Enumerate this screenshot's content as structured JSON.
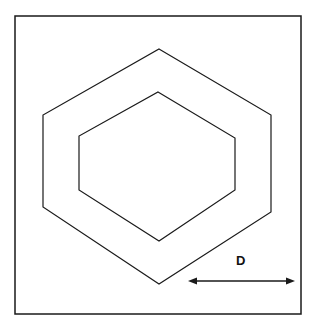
{
  "diagram": {
    "frame": {
      "x": 15,
      "y": 16,
      "width": 286,
      "height": 298
    },
    "outer_hexagon": [
      [
        159,
        49
      ],
      [
        271,
        115
      ],
      [
        271,
        212
      ],
      [
        159,
        284
      ],
      [
        43,
        207
      ],
      [
        43,
        115
      ]
    ],
    "inner_hexagon": [
      [
        158,
        92
      ],
      [
        235,
        138
      ],
      [
        235,
        190
      ],
      [
        159,
        241
      ],
      [
        79,
        190
      ],
      [
        79,
        136
      ]
    ],
    "dimension_arrow": {
      "x1": 188,
      "x2": 295,
      "y": 281
    },
    "dimension_label": "D",
    "stroke_color": "#1a1a1a"
  }
}
